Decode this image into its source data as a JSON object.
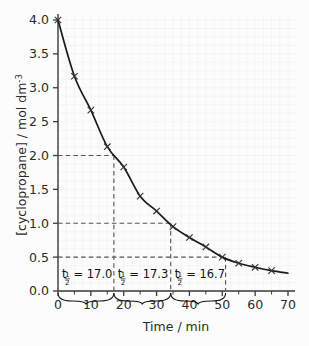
{
  "chart_data": {
    "type": "line",
    "title": "",
    "xlabel": "Time / min",
    "ylabel": "[cyclopropane] / mol dm",
    "ylabel_exponent": "-3",
    "xlim": [
      0,
      72
    ],
    "ylim": [
      0,
      4.1
    ],
    "xticks": [
      "0",
      "10",
      "20",
      "30",
      "40",
      "50",
      "60",
      "70"
    ],
    "xtick_values": [
      0,
      10,
      20,
      30,
      40,
      50,
      60,
      70
    ],
    "yticks": [
      "0.0",
      "0.5",
      "1.0",
      "1.5",
      "2.0",
      "2 5",
      "3.0",
      "3.5",
      "4.0"
    ],
    "ytick_values": [
      0.0,
      0.5,
      1.0,
      1.5,
      2.0,
      2.5,
      3.0,
      3.5,
      4.0
    ],
    "grid": true,
    "legend": "none",
    "marker": "x",
    "x": [
      0,
      5,
      10,
      15,
      20,
      25,
      30,
      35,
      40,
      45,
      50,
      55,
      60,
      65
    ],
    "y": [
      4.0,
      3.17,
      2.67,
      2.13,
      1.83,
      1.4,
      1.18,
      0.95,
      0.79,
      0.65,
      0.5,
      0.41,
      0.35,
      0.3
    ],
    "series": [
      {
        "name": "cyclopropane",
        "values": [
          4.0,
          3.17,
          2.67,
          2.13,
          1.83,
          1.4,
          1.18,
          0.95,
          0.79,
          0.65,
          0.5,
          0.41,
          0.35,
          0.3
        ]
      }
    ],
    "construction_lines": [
      {
        "concentration": 2.0,
        "time": 17.0
      },
      {
        "concentration": 1.0,
        "time": 34.3
      },
      {
        "concentration": 0.5,
        "time": 51.0
      }
    ],
    "annotations": [
      {
        "symbol": "t",
        "subscript": "1/2",
        "equals": "=",
        "value": "17.0",
        "from": 0.0,
        "to": 17.0
      },
      {
        "symbol": "t",
        "subscript": "1/2",
        "equals": "=",
        "value": "17.3",
        "from": 17.0,
        "to": 34.3
      },
      {
        "symbol": "t",
        "subscript": "1/2",
        "equals": "=",
        "value": "16.7",
        "from": 34.3,
        "to": 51.0
      }
    ]
  },
  "colors": {
    "background": "#fcfcfc",
    "grid": "#f0f0f0",
    "axis": "#3a3a3a",
    "curve": "#1a1a1a",
    "dashed": "#4a4a4a",
    "text": "#2b2b2b"
  }
}
